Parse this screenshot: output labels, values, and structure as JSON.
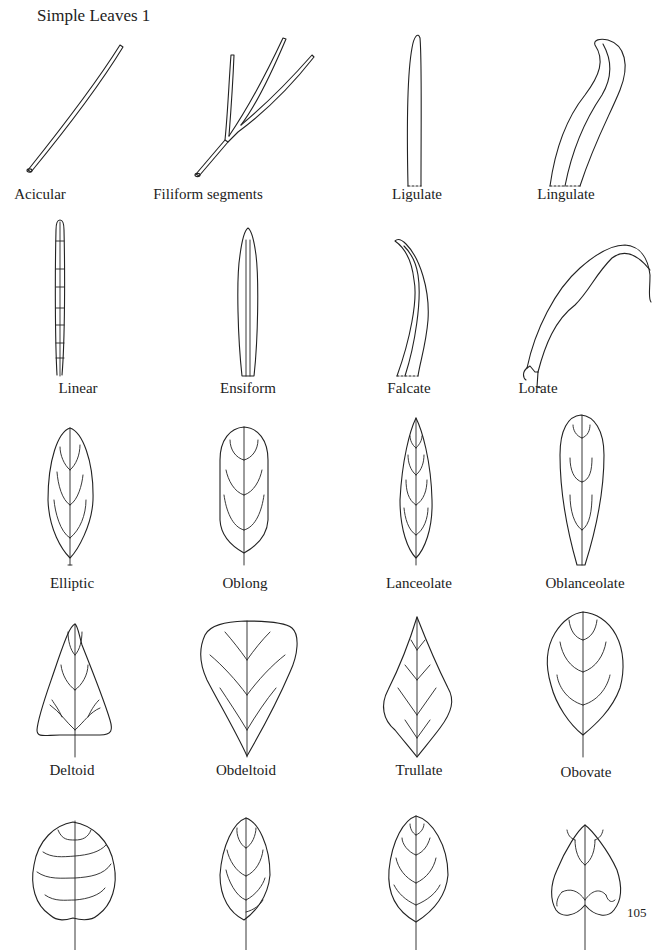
{
  "page": {
    "title": "Simple Leaves 1",
    "page_number": "105"
  },
  "leaves": [
    {
      "id": "acicular",
      "label": "Acicular"
    },
    {
      "id": "filiform",
      "label": "Filiform segments"
    },
    {
      "id": "ligulate",
      "label": "Ligulate"
    },
    {
      "id": "lingulate",
      "label": "Lingulate"
    },
    {
      "id": "linear",
      "label": "Linear"
    },
    {
      "id": "ensiform",
      "label": "Ensiform"
    },
    {
      "id": "falcate",
      "label": "Falcate"
    },
    {
      "id": "lorate",
      "label": "Lorate"
    },
    {
      "id": "elliptic",
      "label": "Elliptic"
    },
    {
      "id": "oblong",
      "label": "Oblong"
    },
    {
      "id": "lanceolate",
      "label": "Lanceolate"
    },
    {
      "id": "oblanceolate",
      "label": "Oblanceolate"
    },
    {
      "id": "deltoid",
      "label": "Deltoid"
    },
    {
      "id": "obdeltoid",
      "label": "Obdeltoid"
    },
    {
      "id": "trullate",
      "label": "Trullate"
    },
    {
      "id": "obovate",
      "label": "Obovate"
    },
    {
      "id": "orbicular-unlabeled",
      "label": ""
    },
    {
      "id": "elliptic-unlabeled",
      "label": ""
    },
    {
      "id": "ovate-unlabeled",
      "label": ""
    },
    {
      "id": "cordate-unlabeled",
      "label": ""
    }
  ]
}
